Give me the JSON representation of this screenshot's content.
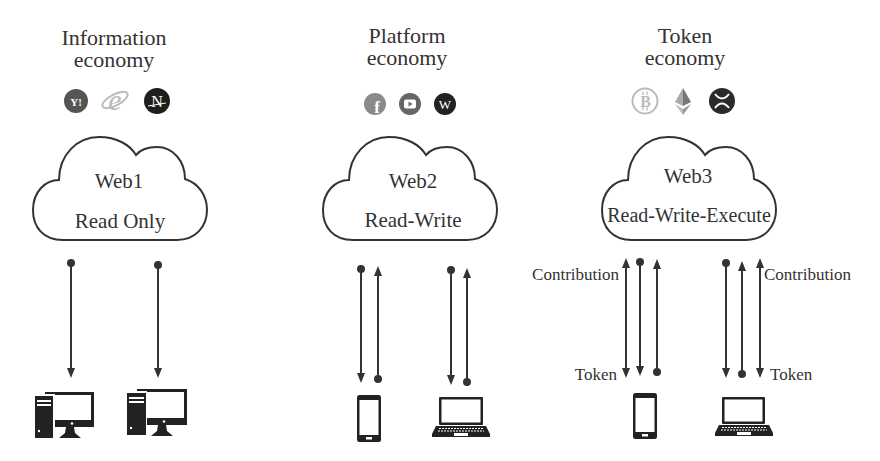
{
  "colors": {
    "line": "#333333",
    "text": "#333333",
    "background": "#ffffff"
  },
  "columns": [
    {
      "title": [
        "Information",
        "economy"
      ],
      "icons": [
        {
          "name": "yahoo-icon",
          "glyph": "Y!"
        },
        {
          "name": "internet-explorer-icon",
          "glyph": "e"
        },
        {
          "name": "netscape-icon",
          "glyph": "N"
        }
      ],
      "cloud": {
        "name": "Web1",
        "mode": "Read Only"
      },
      "devices": [
        "desktop-computer",
        "desktop-computer"
      ],
      "flows": [
        {
          "arrows": [
            "down"
          ]
        },
        {
          "arrows": [
            "down"
          ]
        }
      ]
    },
    {
      "title": [
        "Platform",
        "economy"
      ],
      "icons": [
        {
          "name": "facebook-icon",
          "glyph": "f"
        },
        {
          "name": "youtube-icon",
          "glyph": "play"
        },
        {
          "name": "wordpress-icon",
          "glyph": "W"
        }
      ],
      "cloud": {
        "name": "Web2",
        "mode": "Read-Write"
      },
      "devices": [
        "smartphone",
        "laptop"
      ],
      "flows": [
        {
          "arrows": [
            "down",
            "up"
          ]
        },
        {
          "arrows": [
            "down",
            "up"
          ]
        }
      ]
    },
    {
      "title": [
        "Token",
        "economy"
      ],
      "icons": [
        {
          "name": "bitcoin-icon",
          "glyph": "B"
        },
        {
          "name": "ethereum-icon",
          "glyph": "diamond"
        },
        {
          "name": "xrp-icon",
          "glyph": "X"
        }
      ],
      "cloud": {
        "name": "Web3",
        "mode": "Read-Write-Execute"
      },
      "devices": [
        "smartphone",
        "laptop"
      ],
      "flows": [
        {
          "arrows": [
            "both",
            "down",
            "up"
          ],
          "label_top": "Contribution",
          "label_bottom": "Token"
        },
        {
          "arrows": [
            "down",
            "up",
            "both"
          ],
          "label_top": "Contribution",
          "label_bottom": "Token"
        }
      ]
    }
  ]
}
